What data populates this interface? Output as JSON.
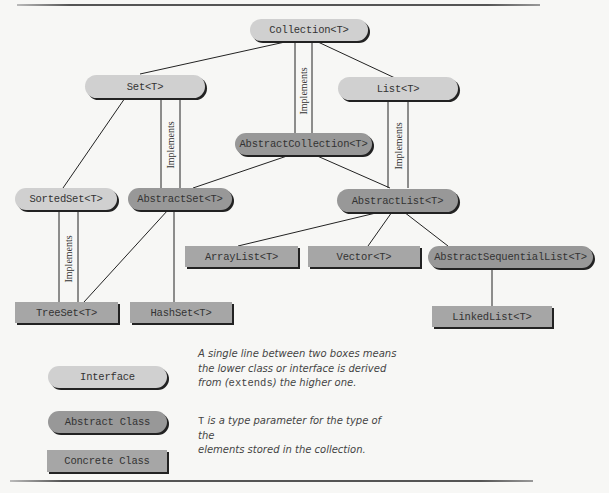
{
  "diagram": {
    "nodes": {
      "collection": {
        "label": "Collection<T>",
        "kind": "interface"
      },
      "set": {
        "label": "Set<T>",
        "kind": "interface"
      },
      "list": {
        "label": "List<T>",
        "kind": "interface"
      },
      "sorted_set": {
        "label": "SortedSet<T>",
        "kind": "interface"
      },
      "abstract_collection": {
        "label": "AbstractCollection<T>",
        "kind": "abstract"
      },
      "abstract_set": {
        "label": "AbstractSet<T>",
        "kind": "abstract"
      },
      "abstract_list": {
        "label": "AbstractList<T>",
        "kind": "abstract"
      },
      "abstract_sequential_list": {
        "label": "AbstractSequentialList<T>",
        "kind": "abstract"
      },
      "array_list": {
        "label": "ArrayList<T>",
        "kind": "concrete"
      },
      "vector": {
        "label": "Vector<T>",
        "kind": "concrete"
      },
      "tree_set": {
        "label": "TreeSet<T>",
        "kind": "concrete"
      },
      "hash_set": {
        "label": "HashSet<T>",
        "kind": "concrete"
      },
      "linked_list": {
        "label": "LinkedList<T>",
        "kind": "concrete"
      }
    },
    "implements_label": "Implements",
    "edges": [
      {
        "from": "set",
        "to": "collection",
        "type": "extends"
      },
      {
        "from": "list",
        "to": "collection",
        "type": "extends"
      },
      {
        "from": "abstract_collection",
        "to": "collection",
        "type": "implements"
      },
      {
        "from": "sorted_set",
        "to": "set",
        "type": "extends"
      },
      {
        "from": "abstract_set",
        "to": "set",
        "type": "implements"
      },
      {
        "from": "abstract_set",
        "to": "abstract_collection",
        "type": "extends"
      },
      {
        "from": "abstract_list",
        "to": "abstract_collection",
        "type": "extends"
      },
      {
        "from": "abstract_list",
        "to": "list",
        "type": "implements"
      },
      {
        "from": "tree_set",
        "to": "sorted_set",
        "type": "implements"
      },
      {
        "from": "tree_set",
        "to": "abstract_set",
        "type": "extends"
      },
      {
        "from": "hash_set",
        "to": "abstract_set",
        "type": "extends"
      },
      {
        "from": "array_list",
        "to": "abstract_list",
        "type": "extends"
      },
      {
        "from": "vector",
        "to": "abstract_list",
        "type": "extends"
      },
      {
        "from": "abstract_sequential_list",
        "to": "abstract_list",
        "type": "extends"
      },
      {
        "from": "linked_list",
        "to": "abstract_sequential_list",
        "type": "extends"
      }
    ]
  },
  "legend": {
    "interface": "Interface",
    "abstract_class": "Abstract Class",
    "concrete_class": "Concrete Class"
  },
  "notes": {
    "line1_a": "A single line between two boxes means",
    "line1_b": "the lower class or interface is derived",
    "line1_c_pre": "from (",
    "line1_c_code": "extends",
    "line1_c_post": ") the higher one.",
    "line2_code": "T",
    "line2_a": " is a type parameter for the type of the",
    "line2_b": "elements stored in the collection."
  },
  "colors": {
    "interface_fill": "#d0d0d0",
    "abstract_fill": "#989898",
    "concrete_fill": "#a6a6a6",
    "line": "#222222"
  }
}
